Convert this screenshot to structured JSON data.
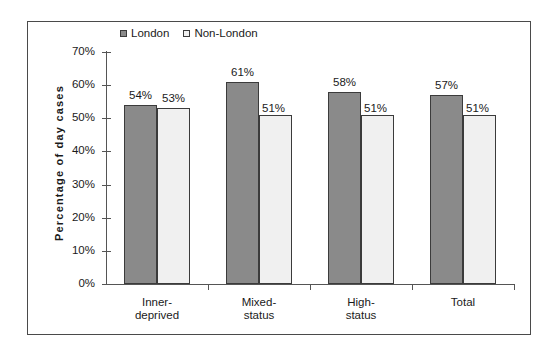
{
  "chart_data": {
    "type": "bar",
    "title": "",
    "xlabel": "",
    "ylabel": "Percentage of day cases",
    "ylim": [
      0,
      70
    ],
    "ytick_labels": [
      "0%",
      "10%",
      "20%",
      "30%",
      "40%",
      "50%",
      "60%",
      "70%"
    ],
    "ytick_values": [
      0,
      10,
      20,
      30,
      40,
      50,
      60,
      70
    ],
    "grid": false,
    "legend_position": "top-center",
    "categories": [
      "Inner-\ndeprived",
      "Mixed-\nstatus",
      "High-\nstatus",
      "Total"
    ],
    "categories_flat": [
      "Inner-deprived",
      "Mixed-status",
      "High-status",
      "Total"
    ],
    "series": [
      {
        "name": "London",
        "color": "#8a8a8a",
        "values": [
          54,
          61,
          58,
          57
        ],
        "data_labels": [
          "54%",
          "61%",
          "58%",
          "57%"
        ]
      },
      {
        "name": "Non-London",
        "color": "#f0f0f0",
        "values": [
          53,
          51,
          51,
          51
        ],
        "data_labels": [
          "53%",
          "51%",
          "51%",
          "51%"
        ]
      }
    ]
  },
  "legend": {
    "items": [
      {
        "label": "London",
        "swatch": "dark"
      },
      {
        "label": "Non-London",
        "swatch": "light"
      }
    ]
  },
  "colors": {
    "london_fill": "#8a8a8a",
    "non_london_fill": "#f0f0f0",
    "bar_outline": "#3b3b3b",
    "axis": "#555555",
    "frame_border": "#4a4a4a",
    "background": "#ffffff",
    "text": "#1a1a1a"
  }
}
